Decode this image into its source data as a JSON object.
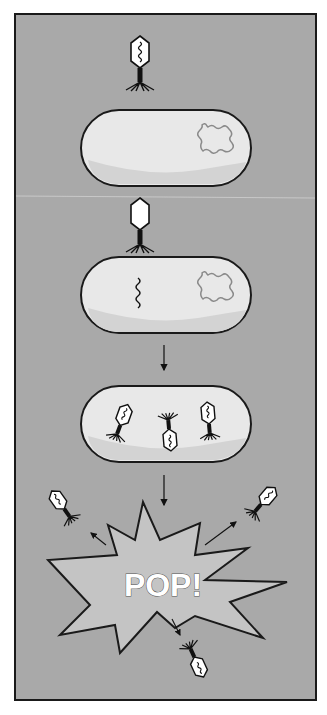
{
  "figure": {
    "colors": {
      "background": "#a9a9a9",
      "frame": "#1a1a1a",
      "cell_fill": "#e8e8e8",
      "cell_shadow": "#d0d0d0",
      "host_dna": "#8a8a8a",
      "phage_head": "#ffffff",
      "phage_ink": "#111111",
      "burst_fill": "#c4c4c4"
    },
    "steps": [
      {
        "id": "attachment",
        "label": "Phage approaches bacterial cell"
      },
      {
        "id": "injection",
        "label": "Phage injects DNA into cell"
      },
      {
        "id": "replication",
        "label": "New phages assemble inside cell"
      },
      {
        "id": "lysis",
        "label": "Cell bursts, releasing phages"
      }
    ],
    "burst_text": "POP!"
  }
}
